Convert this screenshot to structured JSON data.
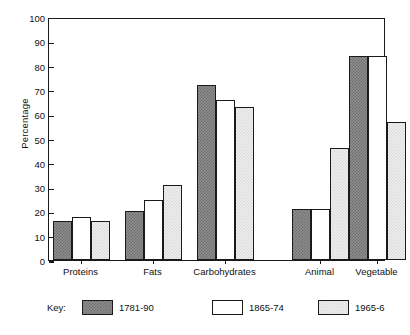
{
  "chart_data": {
    "type": "bar",
    "title": "",
    "xlabel": "",
    "ylabel": "Percentage",
    "ylim": [
      0,
      100
    ],
    "ytick_step": 10,
    "grid": false,
    "legend_position": "bottom",
    "legend_title": "Key:",
    "categories": [
      "Proteins",
      "Fats",
      "Carbohydrates",
      "Animal",
      "Vegetable"
    ],
    "group_gap_after_index": 2,
    "series": [
      {
        "name": "1781-90",
        "swatch": "dark-checker",
        "color": "#8e8e8e",
        "values": [
          16,
          20,
          72,
          21,
          84
        ]
      },
      {
        "name": "1865-74",
        "swatch": "white",
        "color": "#ffffff",
        "values": [
          17.5,
          24.5,
          66,
          21,
          84
        ]
      },
      {
        "name": "1965-6",
        "swatch": "light-stipple",
        "color": "#f0f0f0",
        "values": [
          16,
          31,
          63,
          46,
          57
        ]
      }
    ],
    "ytick_labels": [
      "0",
      "10",
      "20",
      "30",
      "40",
      "50",
      "60",
      "70",
      "80",
      "90",
      "100"
    ],
    "axis_color": "#1a1a1a"
  }
}
